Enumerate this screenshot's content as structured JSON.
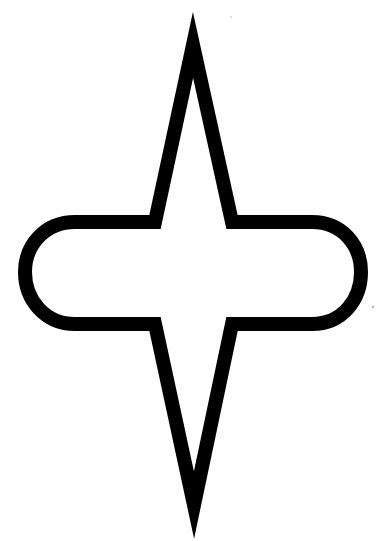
{
  "figure": {
    "stroke_color": "#000000",
    "fill_color": "#ffffff",
    "background_color": "#fefefe",
    "stroke_width": 14
  }
}
